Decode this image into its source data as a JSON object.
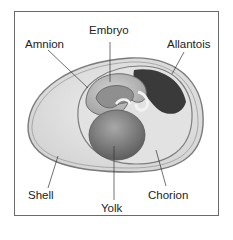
{
  "figure": {
    "labels": {
      "embryo": "Embryo",
      "amnion": "Amnion",
      "allantois": "Allantois",
      "shell": "Shell",
      "chorion": "Chorion",
      "yolk": "Yolk"
    }
  },
  "colors": {
    "frame": "#6a6a6a",
    "shell": "#d9d9d9",
    "albumen": "#e6e6e6",
    "chorion_line": "#8a8a8a",
    "yolk": "#7d7d7d",
    "allantois": "#3a3a3a",
    "embryo": "#8f8f8f"
  }
}
